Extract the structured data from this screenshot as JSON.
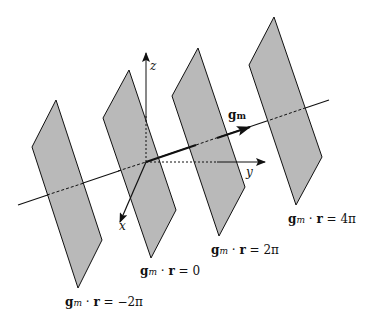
{
  "figure": {
    "colors": {
      "plane_fill": "#b9b9b9",
      "stroke": "#111111",
      "background": "#ffffff"
    },
    "axes": {
      "x_label": "x",
      "y_label": "y",
      "z_label": "z"
    },
    "vector": {
      "label_base": "g",
      "label_sub": "m"
    },
    "planes": [
      {
        "name": "plane-minus-2pi",
        "points": "56,100 32,147 78,288 102,240"
      },
      {
        "name": "plane-0",
        "points": "129,70 103,118 151,258 176,210"
      },
      {
        "name": "plane-2pi",
        "points": "198,48 172,96 219,236 245,187"
      },
      {
        "name": "plane-4pi",
        "points": "274,17 249,65 296,205 322,157"
      }
    ],
    "plane_labels": [
      {
        "lhs_g": "g",
        "lhs_sub": "m",
        "dot": " · ",
        "r": "r",
        "rhs": " = −2π"
      },
      {
        "lhs_g": "g",
        "lhs_sub": "m",
        "dot": " · ",
        "r": "r",
        "rhs": " = 0"
      },
      {
        "lhs_g": "g",
        "lhs_sub": "m",
        "dot": " · ",
        "r": "r",
        "rhs": " = 2π"
      },
      {
        "lhs_g": "g",
        "lhs_sub": "m",
        "dot": " · ",
        "r": "r",
        "rhs": " = 4π"
      }
    ]
  }
}
